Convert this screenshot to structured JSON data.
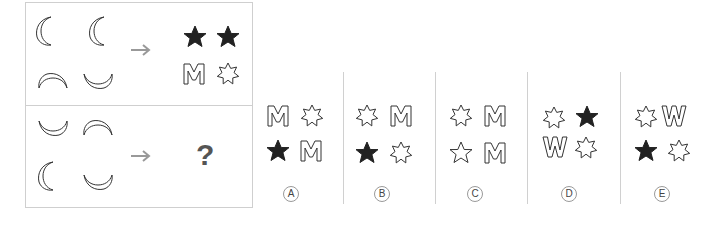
{
  "puzzle": {
    "question_mark": "?",
    "row1": {
      "inputs": [
        "crescent-left",
        "crescent-left",
        "crescent-up",
        "crescent-down"
      ],
      "outputs": [
        "star5-filled",
        "star5-filled",
        "letter-M-outline",
        "star7-outline"
      ]
    },
    "row2": {
      "inputs": [
        "crescent-down",
        "crescent-up",
        "crescent-left",
        "crescent-down"
      ],
      "outputs": "?"
    }
  },
  "options": [
    {
      "label": "A",
      "items": [
        "M",
        "star7-outline",
        "star5-filled",
        "M"
      ]
    },
    {
      "label": "B",
      "items": [
        "star7-outline",
        "M",
        "star5-filled",
        "star7-outline"
      ]
    },
    {
      "label": "C",
      "items": [
        "star7-outline",
        "M",
        "star5-outline",
        "M"
      ]
    },
    {
      "label": "D",
      "items": [
        "star7-outline",
        "star5-filled",
        "W",
        "star7-outline"
      ]
    },
    {
      "label": "E",
      "items": [
        "star7-outline",
        "W",
        "star5-filled",
        "star7-outline"
      ]
    }
  ],
  "colors": {
    "stroke": "#333333",
    "fill_dark": "#222222",
    "arrow": "#999999",
    "border": "#cfcfcf"
  }
}
